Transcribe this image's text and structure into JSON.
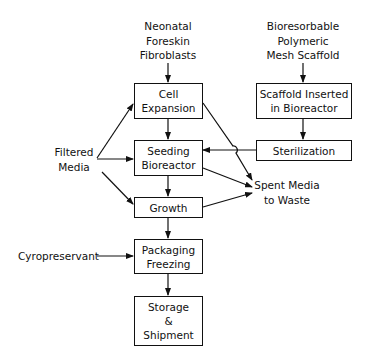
{
  "inputs": {
    "fibroblasts": [
      "Neonatal",
      "Foreskin",
      "Fibroblasts"
    ],
    "scaffold": [
      "Bioresorbable",
      "Polymeric",
      "Mesh Scaffold"
    ],
    "filtered_media": [
      "Filtered",
      "Media"
    ],
    "cryopreservant": "Cyropreservant"
  },
  "boxes": {
    "cell_expansion": [
      "Cell",
      "Expansion"
    ],
    "seeding_bioreactor": [
      "Seeding",
      "Bioreactor"
    ],
    "growth": [
      "Growth"
    ],
    "packaging_freezing": [
      "Packaging",
      "Freezing"
    ],
    "storage_shipment": [
      "Storage",
      "&",
      "Shipment"
    ],
    "scaffold_inserted": [
      "Scaffold Inserted",
      "in Bioreactor"
    ],
    "sterilization": [
      "Sterilization"
    ]
  },
  "outputs": {
    "spent_media": [
      "Spent Media",
      "to Waste"
    ]
  }
}
